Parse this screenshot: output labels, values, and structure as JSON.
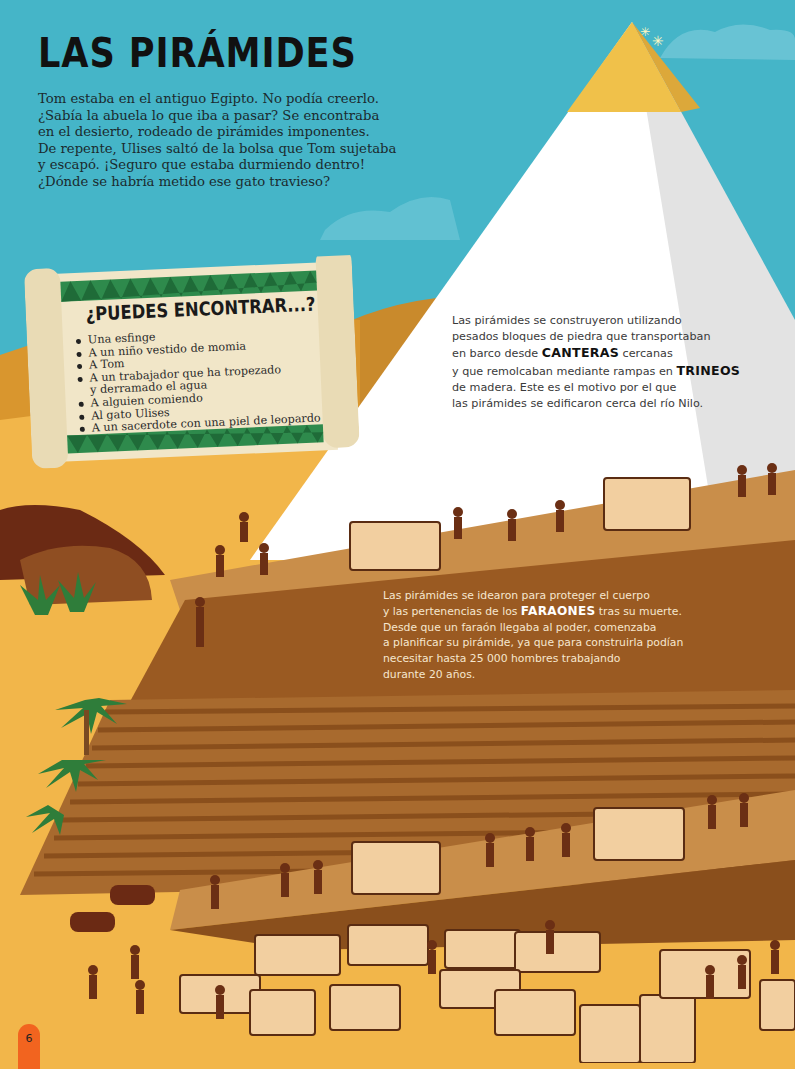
{
  "page": {
    "title": "LAS PIRÁMIDES",
    "page_number": "6"
  },
  "intro": {
    "lines": [
      "Tom estaba en el antiguo Egipto. No podía creerlo.",
      "¿Sabía la abuela lo que iba a pasar? Se encontraba",
      "en el desierto, rodeado de pirámides imponentes.",
      "De repente, Ulises saltó de la bolsa que Tom sujetaba",
      "y escapó. ¡Seguro que estaba durmiendo dentro!",
      "¿Dónde se habría metido ese gato travieso?"
    ]
  },
  "find_scroll": {
    "heading": "¿PUEDES ENCONTRAR...?",
    "items": [
      "Una esfinge",
      "A un niño vestido de momia",
      "A Tom",
      "A un trabajador que ha tropezado",
      "y derramado el agua",
      "A alguien comiendo",
      "Al gato Ulises",
      "A un sacerdote con una piel de leopardo"
    ]
  },
  "info_construction": {
    "line1": "Las pirámides se construyeron utilizando",
    "line2": "pesados bloques de piedra que transportaban",
    "line3_pre": "en barco desde ",
    "line3_kw": "CANTERAS",
    "line3_post": " cercanas",
    "line4_pre": "y que remolcaban mediante rampas en ",
    "line4_kw": "TRINEOS",
    "line5": "de madera. Este es el motivo por el que",
    "line6": "las pirámides se edificaron cerca del río Nilo."
  },
  "info_pharaohs": {
    "line1": "Las pirámides se idearon para proteger el cuerpo",
    "line2_pre": "y las pertenencias de los ",
    "line2_kw": "FARAONES",
    "line2_post": " tras su muerte.",
    "line3": "Desde que un faraón llegaba al poder, comenzaba",
    "line4": "a planificar su pirámide, ya que para construirla podían",
    "line5": "necesitar hasta 25 000 hombres trabajando",
    "line6": "durante 20 años."
  },
  "colors": {
    "sky": "#45b5c8",
    "sand": "#f2b64a",
    "pyramid_white": "#ffffff",
    "pyramid_shadow": "#e6e6e6",
    "capstone_gold": "#f0c14a",
    "ramp_brown": "#9a5a22",
    "steps_brown": "#a86a2e",
    "scroll_paper": "#f1e6c8",
    "scroll_green": "#2e8a4c",
    "page_tab": "#f2641f"
  }
}
